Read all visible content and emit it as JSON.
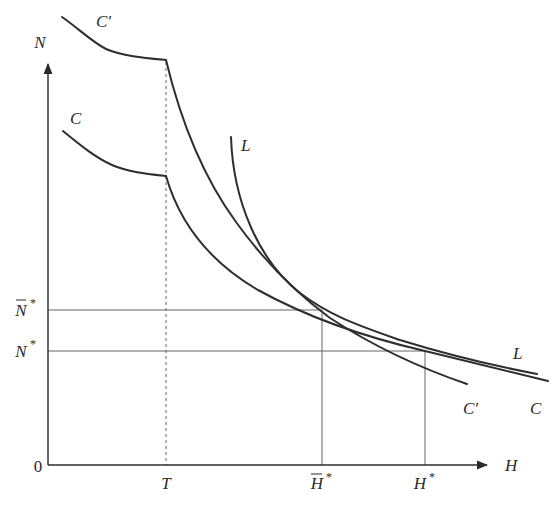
{
  "figure": {
    "axes": {
      "x_label": "H",
      "y_label": "N",
      "origin_label": "0"
    },
    "x_ticks": [
      {
        "label": "T",
        "bar": false
      },
      {
        "label": "H",
        "bar": true,
        "sup": "*"
      },
      {
        "label": "H",
        "bar": false,
        "sup": "*"
      }
    ],
    "y_ticks": [
      {
        "label": "N",
        "bar": true,
        "sup": "*"
      },
      {
        "label": "N",
        "bar": false,
        "sup": "*"
      }
    ],
    "curves": [
      {
        "name": "C′",
        "label_top": "C′",
        "label_bottom": "C′"
      },
      {
        "name": "C",
        "label_top": "C",
        "label_bottom": "C"
      },
      {
        "name": "L",
        "label_top": "L",
        "label_bottom": "L"
      }
    ],
    "colors": {
      "ink": "#2a2a2a",
      "guide": "#555555",
      "background": "#ffffff"
    }
  }
}
